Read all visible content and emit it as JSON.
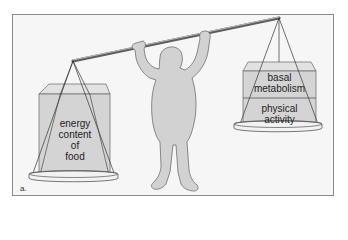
{
  "figure": {
    "panel_label": "a.",
    "left_pan": {
      "label_lines": [
        "energy",
        "content",
        "of",
        "food"
      ]
    },
    "right_pan": {
      "upper_label_lines": [
        "basal",
        "metabolism"
      ],
      "lower_label_lines": [
        "physical",
        "activity"
      ]
    },
    "colors": {
      "frame_bg": "#f6f6f6",
      "frame_border": "#8a8a8a",
      "box_fill": "#d4d4d4",
      "box_top": "#e0e0e0",
      "person_fill": "#d2d2d2",
      "outline": "#555555",
      "bar": "#7a7a7a"
    }
  }
}
